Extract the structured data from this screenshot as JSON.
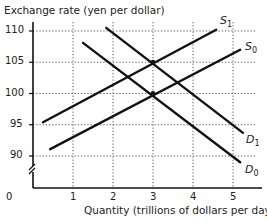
{
  "chart_data": {
    "type": "line",
    "title": "",
    "xlabel": "Quantity (trillions of dollars per day)",
    "ylabel": "Exchange rate (yen per dollar)",
    "xlim": [
      0,
      5.5
    ],
    "ylim": [
      86,
      112
    ],
    "x_ticks": [
      "0",
      "1",
      "2",
      "3",
      "4",
      "5"
    ],
    "y_ticks": [
      "90",
      "95",
      "100",
      "105",
      "110"
    ],
    "y_axis_break": true,
    "grid": "dotted",
    "series": [
      {
        "name": "S1",
        "label_main": "S",
        "label_sub": "1",
        "points": [
          [
            0.25,
            95.4
          ],
          [
            4.58,
            110.2
          ]
        ]
      },
      {
        "name": "S0",
        "label_main": "S",
        "label_sub": "0",
        "points": [
          [
            0.43,
            91.1
          ],
          [
            5.18,
            107.0
          ]
        ]
      },
      {
        "name": "D1",
        "label_main": "D",
        "label_sub": "1",
        "points": [
          [
            1.83,
            110.5
          ],
          [
            5.25,
            93.7
          ]
        ]
      },
      {
        "name": "D0",
        "label_main": "D",
        "label_sub": "0",
        "points": [
          [
            1.25,
            108.1
          ],
          [
            5.18,
            89.0
          ]
        ]
      }
    ],
    "annotations": [
      {
        "type": "equilibrium",
        "x": 3,
        "y": 100,
        "curves": [
          "S0",
          "D0"
        ]
      },
      {
        "type": "equilibrium",
        "x": 3,
        "y": 105,
        "curves": [
          "S1",
          "D1"
        ]
      }
    ]
  }
}
